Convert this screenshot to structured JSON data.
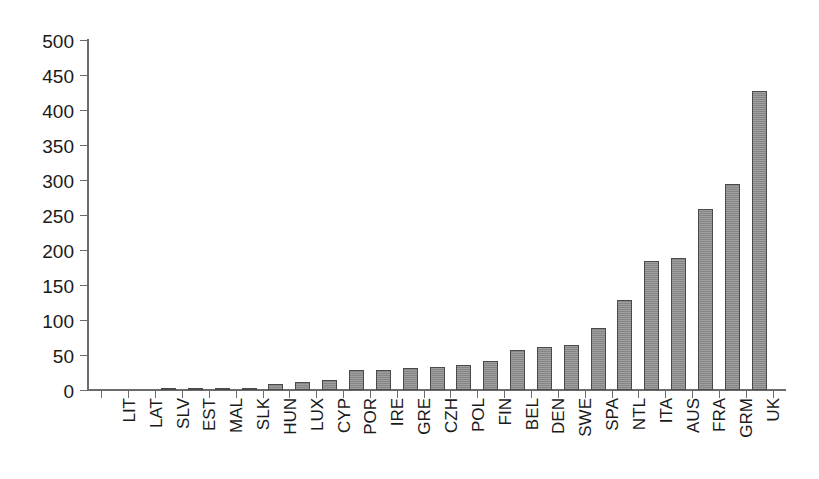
{
  "chart_data": {
    "type": "bar",
    "title": "",
    "subtitle": "",
    "xlabel": "",
    "ylabel": "",
    "ylim": [
      0,
      500
    ],
    "ytick_values": [
      0,
      50,
      100,
      150,
      200,
      250,
      300,
      350,
      400,
      450,
      500
    ],
    "ytick_labels": [
      "0",
      "50",
      "100",
      "150",
      "200",
      "250",
      "300",
      "350",
      "400",
      "450",
      "500"
    ],
    "grid": false,
    "legend": false,
    "legend_position": "none",
    "bar_color": "#8d8d8d",
    "bar_edge_color": "#4a4a4a",
    "axis_color": "#6b6b6b",
    "categories": [
      "LIT",
      "LAT",
      "SLV",
      "EST",
      "MAL",
      "SLK",
      "HUN",
      "LUX",
      "CYP",
      "POR",
      "IRE",
      "GRE",
      "CZH",
      "POL",
      "FIN",
      "BEL",
      "DEN",
      "SWE",
      "SPA",
      "NTL",
      "ITA",
      "AUS",
      "FRA",
      "GRM",
      "UK"
    ],
    "values": [
      1,
      1,
      2,
      3,
      3,
      3,
      9,
      12,
      15,
      29,
      29,
      32,
      33,
      36,
      41,
      57,
      62,
      65,
      88,
      128,
      184,
      189,
      259,
      294,
      427
    ],
    "series": [
      {
        "name": "value",
        "values": [
          1,
          1,
          2,
          3,
          3,
          3,
          9,
          12,
          15,
          29,
          29,
          32,
          33,
          36,
          41,
          57,
          62,
          65,
          88,
          128,
          184,
          189,
          259,
          294,
          427
        ]
      }
    ]
  }
}
